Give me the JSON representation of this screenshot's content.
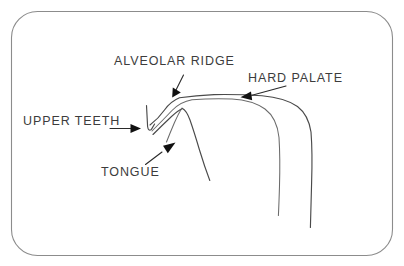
{
  "figure": {
    "background_color": "#ffffff",
    "frame_color": "#8c8c8c",
    "line_color": "#4a4a4a",
    "text_color": "#3c3c3c",
    "arrow_color": "#111111"
  },
  "labels": {
    "alveolar_ridge": "ALVEOLAR RIDGE",
    "hard_palate": "HARD PALATE",
    "upper_teeth": "UPPER TEETH",
    "tongue": "TONGUE"
  },
  "annotations": [
    {
      "id": "alveolar-ridge",
      "text": "ALVEOLAR RIDGE",
      "text_anchor": "start",
      "text_x": 114,
      "text_y": 62,
      "leader_from": [
        182,
        78
      ],
      "leader_to": [
        174,
        95
      ],
      "arrow_direction": "down-left"
    },
    {
      "id": "hard-palate",
      "text": "HARD PALATE",
      "text_anchor": "start",
      "text_x": 248,
      "text_y": 79,
      "leader_from": [
        282,
        88
      ],
      "leader_to": [
        244,
        97
      ],
      "arrow_direction": "left"
    },
    {
      "id": "upper-teeth",
      "text": "UPPER TEETH",
      "text_anchor": "start",
      "text_x": 23,
      "text_y": 122,
      "leader_from": [
        112,
        128
      ],
      "leader_to": [
        140,
        128
      ],
      "arrow_direction": "right"
    },
    {
      "id": "tongue",
      "text": "TONGUE",
      "text_anchor": "start",
      "text_x": 101,
      "text_y": 173,
      "leader_from": [
        147,
        163
      ],
      "leader_to": [
        175,
        143
      ],
      "arrow_direction": "up-right"
    }
  ],
  "anatomy_parts": [
    {
      "id": "upper-teeth-shape",
      "name": "upper teeth"
    },
    {
      "id": "alveolar-ridge-curve",
      "name": "alveolar ridge"
    },
    {
      "id": "hard-palate-curve",
      "name": "hard palate"
    },
    {
      "id": "velum-pharynx-curve",
      "name": "velum and pharyngeal wall"
    },
    {
      "id": "tongue-body-curve",
      "name": "tongue body"
    },
    {
      "id": "tongue-root-curve",
      "name": "tongue root"
    }
  ]
}
